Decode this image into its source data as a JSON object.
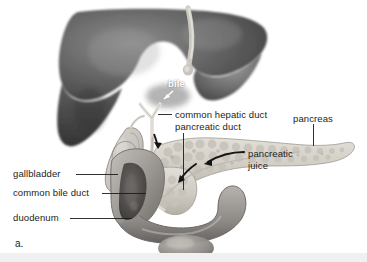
{
  "figure": {
    "panel_letter": "a.",
    "kind": "anatomical-illustration",
    "style": "grayscale medical illustration"
  },
  "labels": {
    "bile": "bile",
    "common_hepatic_duct": "common hepatic duct",
    "pancreatic_duct": "pancreatic duct",
    "pancreas": "pancreas",
    "pancreatic_juice_line1": "pancreatic",
    "pancreatic_juice_line2": "juice",
    "gallbladder": "gallbladder",
    "common_bile_duct": "common bile duct",
    "duodenum": "duodenum"
  },
  "colors": {
    "background": "#ffffff",
    "text": "#1c1c1c",
    "white_text": "#ffffff",
    "leader_line": "#1c1c1c",
    "liver_dark": "#4a4a4a",
    "liver_mid": "#6b6b6b",
    "liver_light": "#8f8f8f",
    "pancreas_light": "#d8d4cc",
    "pancreas_shade": "#b9b5ad",
    "duodenum_mid": "#a9a6a2",
    "duodenum_dark": "#6f6c69",
    "duodenum_lumen": "#555250",
    "gallbladder_light": "#cfcbc6",
    "duct_pale": "#ddd9d2",
    "bottom_strip": "#f0f0f0"
  },
  "organs": [
    {
      "name": "liver",
      "position": "upper-left",
      "shade": "dark grey with soft gradient"
    },
    {
      "name": "gallbladder",
      "position": "center-left",
      "shade": "light grey pear shape"
    },
    {
      "name": "pancreas",
      "position": "right",
      "shade": "pale lumpy textured body tapering to tail"
    },
    {
      "name": "duodenum",
      "position": "bottom-center",
      "shade": "grey C-shaped tube with dark lumen"
    },
    {
      "name": "common hepatic duct",
      "position": "center",
      "shade": "pale narrow tube"
    },
    {
      "name": "common bile duct",
      "position": "center",
      "shade": "pale narrow tube"
    },
    {
      "name": "pancreatic duct",
      "position": "center",
      "shade": "pale narrow tube"
    }
  ],
  "arrows": [
    {
      "name": "bile-arrow",
      "color": "#ffffff",
      "direction": "down-left"
    },
    {
      "name": "bile-flow-arrow",
      "color": "#1c1c1c",
      "direction": "down"
    },
    {
      "name": "pancreatic-juice-arrow",
      "color": "#1c1c1c",
      "direction": "left-curved"
    }
  ]
}
